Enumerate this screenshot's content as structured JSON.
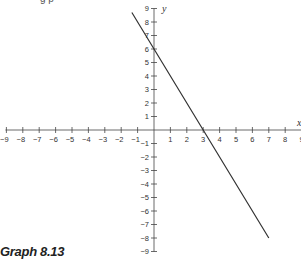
{
  "top_fragment": "g p",
  "caption": "Graph 8.13",
  "colors": {
    "axis": "#444444",
    "line": "#333333",
    "text": "#333333"
  },
  "chart_data": {
    "type": "line",
    "title": "Graph 8.13",
    "xlabel": "x",
    "ylabel": "y",
    "xlim": [
      -9,
      9
    ],
    "ylim": [
      -9,
      9
    ],
    "grid": false,
    "x_ticks": [
      -9,
      -8,
      -7,
      -6,
      -5,
      -4,
      -3,
      -2,
      -1,
      1,
      2,
      3,
      4,
      5,
      6,
      7,
      8,
      9
    ],
    "y_ticks": [
      9,
      8,
      7,
      6,
      5,
      4,
      3,
      2,
      1,
      -1,
      -2,
      -3,
      -4,
      -5,
      -6,
      -7,
      -8,
      -9
    ],
    "series": [
      {
        "name": "y = -2x + 6",
        "equation": "y = -2x + 6",
        "x": [
          -1.35,
          0,
          3,
          7
        ],
        "y": [
          8.7,
          6,
          0,
          -8
        ]
      }
    ],
    "intercepts": {
      "x_intercept": 3,
      "y_intercept": 6
    }
  }
}
